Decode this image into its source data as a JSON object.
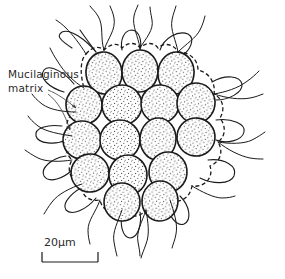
{
  "figure": {
    "type": "scientific-illustration",
    "background_color": "#ffffff",
    "ink_color": "#1a1a1a"
  },
  "annotations": {
    "matrix_label": {
      "line1": "Mucilaginous",
      "line2": "matrix",
      "x": 8,
      "y": 78
    }
  },
  "scale_bar": {
    "label": "20µm",
    "value": 20,
    "unit": "µm",
    "x": 44,
    "y": 240,
    "length_px": 56
  },
  "colony": {
    "cell_count": 16,
    "rows": [
      3,
      4,
      4,
      3,
      2
    ],
    "cells": [
      {
        "cx": 104,
        "cy": 73,
        "rx": 18,
        "ry": 21,
        "rot": -6
      },
      {
        "cx": 140,
        "cy": 71,
        "rx": 18,
        "ry": 21,
        "rot": 2
      },
      {
        "cx": 176,
        "cy": 73,
        "rx": 18,
        "ry": 21,
        "rot": 6
      },
      {
        "cx": 84,
        "cy": 105,
        "rx": 18,
        "ry": 19,
        "rot": -10
      },
      {
        "cx": 122,
        "cy": 105,
        "rx": 20,
        "ry": 20,
        "rot": 0
      },
      {
        "cx": 160,
        "cy": 104,
        "rx": 19,
        "ry": 19,
        "rot": 4
      },
      {
        "cx": 196,
        "cy": 103,
        "rx": 19,
        "ry": 20,
        "rot": 8
      },
      {
        "cx": 82,
        "cy": 140,
        "rx": 19,
        "ry": 19,
        "rot": -4
      },
      {
        "cx": 120,
        "cy": 140,
        "rx": 20,
        "ry": 20,
        "rot": 0
      },
      {
        "cx": 158,
        "cy": 139,
        "rx": 18,
        "ry": 21,
        "rot": 3
      },
      {
        "cx": 196,
        "cy": 137,
        "rx": 19,
        "ry": 19,
        "rot": 6
      },
      {
        "cx": 90,
        "cy": 173,
        "rx": 19,
        "ry": 19,
        "rot": -6
      },
      {
        "cx": 128,
        "cy": 175,
        "rx": 19,
        "ry": 20,
        "rot": 0
      },
      {
        "cx": 168,
        "cy": 172,
        "rx": 19,
        "ry": 20,
        "rot": 4
      },
      {
        "cx": 122,
        "cy": 202,
        "rx": 18,
        "ry": 19,
        "rot": -3
      },
      {
        "cx": 160,
        "cy": 201,
        "rx": 18,
        "ry": 20,
        "rot": 3
      }
    ]
  }
}
